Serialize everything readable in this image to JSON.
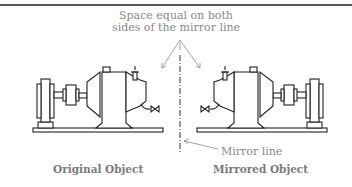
{
  "diagram": {
    "annotation_top": [
      "Space equal on both",
      "sides of the mirror line"
    ],
    "mirror_line_label": "Mirror line",
    "left_caption": "Original Object",
    "right_caption": "Mirrored Object"
  },
  "colors": {
    "line": "#222222",
    "annotation": "#8a8a8a"
  }
}
